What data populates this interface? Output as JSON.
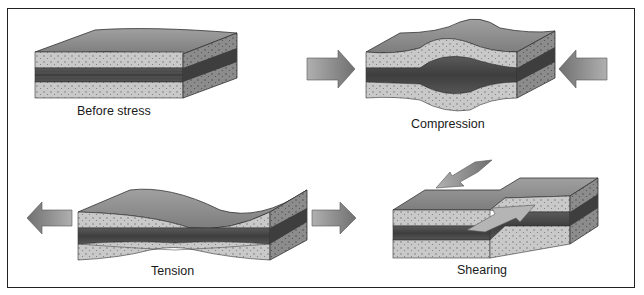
{
  "figure": {
    "panels": [
      {
        "id": "before",
        "label": "Before stress"
      },
      {
        "id": "compression",
        "label": "Compression"
      },
      {
        "id": "tension",
        "label": "Tension"
      },
      {
        "id": "shearing",
        "label": "Shearing"
      }
    ]
  },
  "colors": {
    "frame": "#222222",
    "top_surface": "#8a8a8a",
    "sandstone": "#c8c8c8",
    "dark_layer": "#4a4a4a",
    "side_dark": "#6a6a6a",
    "arrow": "#8e8e8e"
  }
}
